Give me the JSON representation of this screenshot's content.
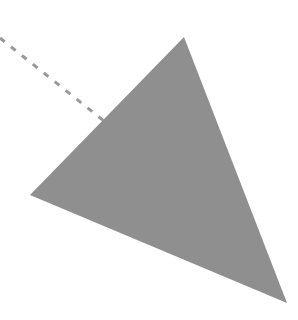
{
  "diagram": {
    "background_color": "#ffffff",
    "shapes": [
      {
        "type": "triangle",
        "name": "gray-triangle",
        "points": [
          [
            184,
            37
          ],
          [
            30,
            195
          ],
          [
            287,
            303
          ]
        ],
        "fill": "#8f8f8f"
      },
      {
        "type": "dashed-line",
        "name": "dashed-connector",
        "from": [
          0,
          38
        ],
        "to": [
          104,
          121
        ],
        "stroke": "#999999",
        "stroke_width": 3,
        "dash": "6 8"
      }
    ]
  }
}
